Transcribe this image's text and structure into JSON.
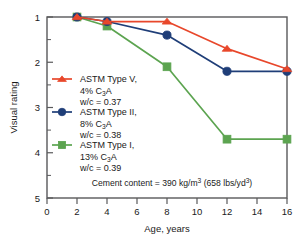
{
  "chart_data": {
    "type": "line",
    "title": "",
    "xlabel": "Age, years",
    "ylabel": "Visual rating",
    "xlim": [
      0,
      16
    ],
    "ylim": [
      1,
      5
    ],
    "y_inverted": true,
    "grid": false,
    "xticks": [
      "0",
      "2",
      "4",
      "6",
      "8",
      "10",
      "12",
      "14",
      "16"
    ],
    "xtick_values": [
      0,
      2,
      4,
      6,
      8,
      10,
      12,
      14,
      16
    ],
    "yticks": [
      "1",
      "2",
      "3",
      "4",
      "5"
    ],
    "ytick_values": [
      1,
      2,
      3,
      4,
      5
    ],
    "legend_position": "center-left inside axes",
    "series": [
      {
        "name": "ASTM Type V",
        "label_line1": "ASTM Type V,",
        "label_line2_pre": "4% C",
        "label_line2_sub": "3",
        "label_line2_post": "A",
        "label_line3": "w/c = 0.37",
        "c3a_percent": 4,
        "wc_ratio": 0.37,
        "color": "#E8472B",
        "marker": "triangle",
        "x": [
          2,
          4,
          8,
          12,
          16
        ],
        "values": [
          1.0,
          1.1,
          1.1,
          1.7,
          2.15
        ]
      },
      {
        "name": "ASTM Type II",
        "label_line1": "ASTM Type II,",
        "label_line2_pre": "8% C",
        "label_line2_sub": "3",
        "label_line2_post": "A",
        "label_line3": "w/c = 0.38",
        "c3a_percent": 8,
        "wc_ratio": 0.38,
        "color": "#1F3E78",
        "marker": "circle",
        "x": [
          2,
          4,
          8,
          12,
          16
        ],
        "values": [
          1.0,
          1.1,
          1.4,
          2.2,
          2.2
        ]
      },
      {
        "name": "ASTM Type I",
        "label_line1": "ASTM Type I,",
        "label_line2_pre": "13% C",
        "label_line2_sub": "3",
        "label_line2_post": "A",
        "label_line3": "w/c = 0.39",
        "c3a_percent": 13,
        "wc_ratio": 0.39,
        "color": "#5CA450",
        "marker": "square",
        "x": [
          2,
          4,
          8,
          12,
          16
        ],
        "values": [
          1.0,
          1.2,
          2.1,
          3.7,
          3.7
        ]
      }
    ],
    "annotation": {
      "pre": "Cement content = 390 kg/m",
      "sup1": "3",
      "mid": " (658 lbs/yd",
      "sup2": "3",
      "post": ")"
    }
  }
}
